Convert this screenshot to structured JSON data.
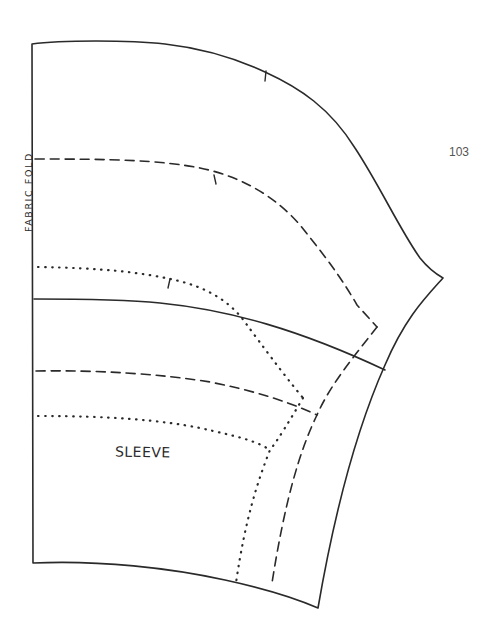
{
  "page": {
    "number": "103"
  },
  "pattern_piece": {
    "name": "SLEEVE",
    "fold_label": "FABRIC FOLD",
    "line_color": "#2a2a2a",
    "line_styles": {
      "cut_line": "solid",
      "seam_line": "dashed",
      "stitching_line": "dotted"
    }
  }
}
